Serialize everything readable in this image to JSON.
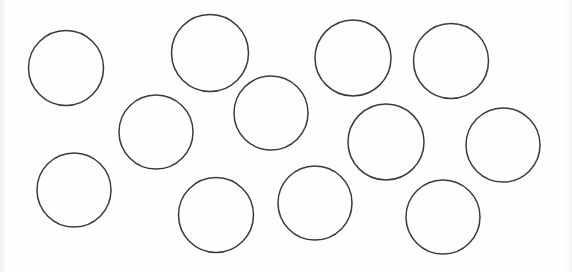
{
  "canvas": {
    "width": 572,
    "height": 272,
    "background_color": "#fefefe",
    "margin_band_color": "#f1f1f3",
    "title": "Circles"
  },
  "drawing": {
    "name": "circle-arrangement",
    "shape_type": "circle",
    "shape_count": 13,
    "stroke_color": "#3a3a3e",
    "fill_color": "none",
    "stroke_width": 1.5,
    "shapes": [
      {
        "id": "circle-1",
        "label": "circle 1",
        "cx": 66,
        "cy": 68,
        "r": 37.5
      },
      {
        "id": "circle-2",
        "label": "circle 2",
        "cx": 210,
        "cy": 53,
        "r": 38.5
      },
      {
        "id": "circle-3",
        "label": "circle 3",
        "cx": 353,
        "cy": 58,
        "r": 38.0
      },
      {
        "id": "circle-4",
        "label": "circle 4",
        "cx": 451,
        "cy": 61,
        "r": 37.5
      },
      {
        "id": "circle-5",
        "label": "circle 5",
        "cx": 156,
        "cy": 132,
        "r": 37.0
      },
      {
        "id": "circle-6",
        "label": "circle 6",
        "cx": 271,
        "cy": 113,
        "r": 37.0
      },
      {
        "id": "circle-7",
        "label": "circle 7",
        "cx": 386,
        "cy": 142,
        "r": 38.0
      },
      {
        "id": "circle-8",
        "label": "circle 8",
        "cx": 503,
        "cy": 145,
        "r": 37.0
      },
      {
        "id": "circle-9",
        "label": "circle 9",
        "cx": 74,
        "cy": 190,
        "r": 37.0
      },
      {
        "id": "circle-10",
        "label": "circle 10",
        "cx": 216,
        "cy": 215,
        "r": 37.5
      },
      {
        "id": "circle-11",
        "label": "circle 11",
        "cx": 315,
        "cy": 203,
        "r": 37.0
      },
      {
        "id": "circle-12",
        "label": "circle 12",
        "cx": 443,
        "cy": 217,
        "r": 37.0
      }
    ]
  }
}
